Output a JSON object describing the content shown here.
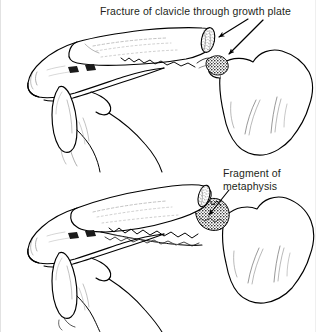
{
  "figure": {
    "width": 316,
    "height": 332,
    "background_color": "#ffffff",
    "ink_color": "#000000",
    "text_color": "#231f20"
  },
  "annotations": {
    "top_label": {
      "text": "Fracture of clavicle through growth plate",
      "x": 99,
      "y": 5,
      "leader_arrows": 2
    },
    "bottom_label": {
      "line1": "Fragment of",
      "line2": "metaphysis",
      "x": 222,
      "y": 167,
      "leader_arrows": 1
    }
  },
  "panels": [
    {
      "name": "upper-panel",
      "description": "Superior view of shoulder girdle showing clavicle fractured through the growth plate at its lateral end, adjacent to the scapula",
      "structures": [
        "clavicle",
        "acromion",
        "scapular-spine",
        "coracoid-process",
        "scapula-body",
        "growth-plate"
      ]
    },
    {
      "name": "lower-panel",
      "description": "Same view with the clavicle displaced, periosteal sleeve split open and a fragment of metaphysis attached",
      "structures": [
        "clavicle",
        "acromion",
        "scapular-spine",
        "coracoid-process",
        "scapula-body",
        "metaphyseal-fragment",
        "periosteal-sleeve"
      ]
    }
  ]
}
